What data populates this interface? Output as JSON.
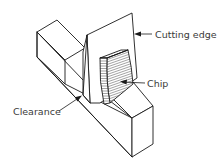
{
  "figure": {
    "type": "isometric line drawing",
    "colors": {
      "line": "#1a1a1a",
      "label": "#3a3a3a",
      "background": "#ffffff"
    }
  },
  "labels": {
    "cutting_edge": "Cutting edge",
    "chip": "Chip",
    "clearance": "Clearance"
  }
}
